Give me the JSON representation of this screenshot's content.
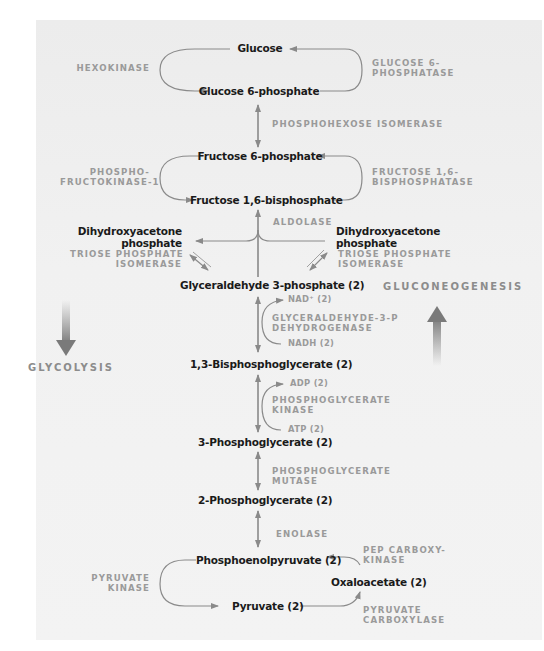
{
  "diagram": {
    "compounds": {
      "glucose": "Glucose",
      "glucose_6_phosphate": "Glucose 6-phosphate",
      "fructose_6_phosphate": "Fructose 6-phosphate",
      "fructose_1_6_bisphosphate": "Fructose 1,6-bisphosphate",
      "dhap_left_line1": "Dihydroxyacetone",
      "dhap_left_line2": "phosphate",
      "dhap_right_line1": "Dihydroxyacetone",
      "dhap_right_line2": "phosphate",
      "glyceraldehyde_3_phosphate": "Glyceraldehyde 3-phosphate (2)",
      "bisphosphoglycerate_1_3": "1,3-Bisphosphoglycerate (2)",
      "phosphoglycerate_3": "3-Phosphoglycerate (2)",
      "phosphoglycerate_2": "2-Phosphoglycerate (2)",
      "phosphoenolpyruvate": "Phosphoenolpyruvate (2)",
      "pyruvate": "Pyruvate (2)",
      "oxaloacetate": "Oxaloacetate (2)"
    },
    "enzymes": {
      "hexokinase": "HEXOKINASE",
      "glucose_6_phosphatase_line1": "GLUCOSE 6-",
      "glucose_6_phosphatase_line2": "PHOSPHATASE",
      "phosphohexose_isomerase": "PHOSPHOHEXOSE ISOMERASE",
      "pfk1_line1": "PHOSPHO-",
      "pfk1_line2": "FRUCTOKINASE-1",
      "fbpase_line1": "FRUCTOSE 1,6-",
      "fbpase_line2": "BISPHOSPHATASE",
      "aldolase": "ALDOLASE",
      "tpi_left_line1": "TRIOSE PHOSPHATE",
      "tpi_left_line2": "ISOMERASE",
      "tpi_right_line1": "TRIOSE PHOSPHATE",
      "tpi_right_line2": "ISOMERASE",
      "gapdh_line1": "GLYCERALDEHYDE-3-P",
      "gapdh_line2": "DEHYDROGENASE",
      "pgk_line1": "PHOSPHOGLYCERATE",
      "pgk_line2": "KINASE",
      "pgm_line1": "PHOSPHOGLYCERATE",
      "pgm_line2": "MUTASE",
      "enolase": "ENOLASE",
      "pyruvate_kinase_line1": "PYRUVATE",
      "pyruvate_kinase_line2": "KINASE",
      "pepck_line1": "PEP CARBOXY-",
      "pepck_line2": "KINASE",
      "pyruvate_carboxylase_line1": "PYRUVATE",
      "pyruvate_carboxylase_line2": "CARBOXYLASE"
    },
    "cofactors": {
      "nad": "NAD⁺ (2)",
      "nadh": "NADH (2)",
      "adp": "ADP (2)",
      "atp": "ATP (2)"
    },
    "directions": {
      "glycolysis": "GLYCOLYSIS",
      "gluconeogenesis": "GLUCONEOGENESIS"
    },
    "colors": {
      "arrow": "#8a8a8a",
      "enzyme_text": "#9a9a9a",
      "compound_text": "#1a1a1a",
      "panel": "#efefef"
    }
  }
}
